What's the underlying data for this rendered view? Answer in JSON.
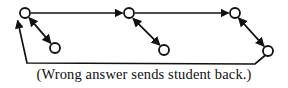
{
  "figure": {
    "caption": "(Wrong answer sends student back.)",
    "colors": {
      "background": "#ffffff",
      "stroke": "#111111",
      "node_fill": "#ffffff",
      "text": "#111111"
    },
    "style": {
      "node_radius": 5,
      "stroke_width": 1.7,
      "arrow_size": 7
    },
    "nodes": [
      {
        "id": "n1",
        "label": "",
        "row": "top",
        "x": 25,
        "y": 13
      },
      {
        "id": "n2",
        "label": "",
        "row": "bottom",
        "x": 55,
        "y": 48
      },
      {
        "id": "n3",
        "label": "",
        "row": "top",
        "x": 129,
        "y": 13
      },
      {
        "id": "n4",
        "label": "",
        "row": "bottom",
        "x": 164,
        "y": 50
      },
      {
        "id": "n5",
        "label": "",
        "row": "top",
        "x": 235,
        "y": 13
      },
      {
        "id": "n6",
        "label": "",
        "row": "bottom",
        "x": 268,
        "y": 51
      }
    ],
    "edges": [
      {
        "id": "e1",
        "from": "n1",
        "to": "n3",
        "kind": "forward-horizontal",
        "arrow": "end"
      },
      {
        "id": "e2",
        "from": "n3",
        "to": "n5",
        "kind": "forward-horizontal",
        "arrow": "end"
      },
      {
        "id": "e3",
        "from": "n1",
        "to": "n2",
        "kind": "diagonal-branch",
        "arrow": "both"
      },
      {
        "id": "e4",
        "from": "n3",
        "to": "n4",
        "kind": "diagonal-branch",
        "arrow": "both"
      },
      {
        "id": "e5",
        "from": "n5",
        "to": "n6",
        "kind": "diagonal-branch",
        "arrow": "both"
      },
      {
        "id": "e6",
        "from": "n6",
        "to": "n1",
        "kind": "return-path",
        "arrow": "end"
      }
    ],
    "return_path": {
      "points": "268,51 255,64 27,63 17,19",
      "corner_left_x": 27,
      "corner_left_y": 63,
      "corner_right_x": 255,
      "corner_right_y": 64,
      "tip_x": 17,
      "tip_y": 19
    }
  }
}
